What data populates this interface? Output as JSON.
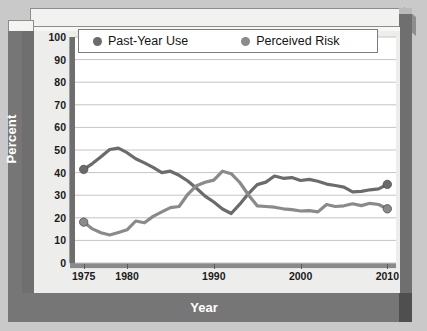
{
  "chart_data": {
    "type": "line",
    "title": "",
    "xlabel": "Year",
    "ylabel": "Percent",
    "xlim": [
      1974,
      2011
    ],
    "ylim": [
      0,
      100
    ],
    "ytick_labels": [
      "100",
      "90",
      "80",
      "70",
      "60",
      "50",
      "40",
      "30",
      "20",
      "10",
      "0"
    ],
    "ytick_values": [
      100,
      90,
      80,
      70,
      60,
      50,
      40,
      30,
      20,
      10,
      0
    ],
    "xtick_labels": [
      "1975",
      "1980",
      "1990",
      "2000",
      "2010"
    ],
    "xtick_values": [
      1975,
      1980,
      1990,
      2000,
      2010
    ],
    "grid": true,
    "legend_position": "top",
    "series": [
      {
        "name": "Past-Year Use",
        "color": "#6b6b6b",
        "marker_color": "#6b6b6b",
        "x": [
          1975,
          1976,
          1977,
          1978,
          1979,
          1980,
          1981,
          1982,
          1983,
          1984,
          1985,
          1986,
          1987,
          1988,
          1989,
          1990,
          1991,
          1992,
          1993,
          1994,
          1995,
          1996,
          1997,
          1998,
          1999,
          2000,
          2001,
          2002,
          2003,
          2004,
          2005,
          2006,
          2007,
          2008,
          2009,
          2010
        ],
        "values": [
          41.4,
          44.0,
          47.0,
          50.2,
          50.8,
          48.8,
          46.1,
          44.3,
          42.3,
          40.0,
          40.6,
          38.8,
          36.3,
          33.1,
          29.6,
          27.0,
          23.9,
          21.9,
          26.0,
          30.7,
          34.7,
          35.8,
          38.5,
          37.5,
          37.8,
          36.5,
          37.0,
          36.2,
          34.9,
          34.3,
          33.6,
          31.5,
          31.7,
          32.4,
          32.8,
          34.8
        ],
        "endpoint_labels": {
          "first": 41.4,
          "last": 34.8
        }
      },
      {
        "name": "Perceived Risk",
        "color": "#8a8a8a",
        "marker_color": "#8a8a8a",
        "x": [
          1975,
          1976,
          1977,
          1978,
          1979,
          1980,
          1981,
          1982,
          1983,
          1984,
          1985,
          1986,
          1987,
          1988,
          1989,
          1990,
          1991,
          1992,
          1993,
          1994,
          1995,
          1996,
          1997,
          1998,
          1999,
          2000,
          2001,
          2002,
          2003,
          2004,
          2005,
          2006,
          2007,
          2008,
          2009,
          2010
        ],
        "values": [
          18.1,
          15.1,
          13.4,
          12.4,
          13.5,
          14.7,
          18.6,
          17.8,
          20.6,
          22.6,
          24.5,
          25.0,
          30.4,
          34.2,
          35.7,
          36.7,
          40.6,
          39.5,
          35.6,
          30.1,
          25.3,
          25.0,
          24.7,
          24.0,
          23.6,
          23.0,
          23.2,
          22.6,
          25.9,
          25.0,
          25.3,
          26.2,
          25.4,
          26.4,
          25.9,
          24.0
        ],
        "endpoint_labels": {
          "first": 18.1,
          "last": 24.0
        }
      }
    ]
  },
  "legend": {
    "items": [
      {
        "label": "Past-Year Use",
        "color": "#6b6b6b"
      },
      {
        "label": "Perceived Risk",
        "color": "#8a8a8a"
      }
    ]
  },
  "axes": {
    "y_title": "Percent",
    "x_title": "Year"
  }
}
